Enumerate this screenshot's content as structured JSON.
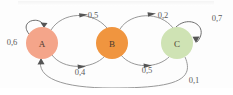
{
  "diagram": {
    "background_color": "#fdfdfd",
    "stroke_color": "#8c8c8c",
    "nodes": [
      {
        "id": "A",
        "label": "A",
        "color": "#f4a58a",
        "cx": 42,
        "cy": 43,
        "r": 16
      },
      {
        "id": "B",
        "label": "B",
        "color": "#f0953f",
        "cx": 112,
        "cy": 43,
        "r": 16
      },
      {
        "id": "C",
        "label": "C",
        "color": "#cfe3b4",
        "cx": 177,
        "cy": 43,
        "r": 16
      }
    ],
    "edges": [
      {
        "id": "a-self",
        "from": "A",
        "to": "A",
        "label": "0,6",
        "label_x": 12,
        "label_y": 42,
        "kind": "self-loop-left"
      },
      {
        "id": "a-to-b",
        "from": "A",
        "to": "B",
        "label": "0,5",
        "label_x": 93,
        "label_y": 15,
        "kind": "arc-top"
      },
      {
        "id": "b-to-a",
        "from": "A",
        "to": "B",
        "label": "0,4",
        "label_x": 80,
        "label_y": 72,
        "kind": "arc-bottom"
      },
      {
        "id": "b-to-c",
        "from": "B",
        "to": "C",
        "label": "0,2",
        "label_x": 163,
        "label_y": 15,
        "kind": "arc-top"
      },
      {
        "id": "c-to-b",
        "from": "B",
        "to": "C",
        "label": "0,5",
        "label_x": 147,
        "label_y": 70,
        "kind": "arc-bottom"
      },
      {
        "id": "c-self",
        "from": "C",
        "to": "C",
        "label": "0,7",
        "label_x": 217,
        "label_y": 18,
        "kind": "self-loop-right"
      },
      {
        "id": "c-to-a",
        "from": "C",
        "to": "A",
        "label": "0,1",
        "label_x": 194,
        "label_y": 80,
        "kind": "arc-long-bottom"
      }
    ]
  }
}
